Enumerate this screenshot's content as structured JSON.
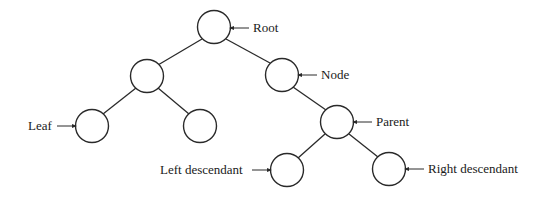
{
  "diagram": {
    "type": "binary-tree",
    "nodes": [
      {
        "id": "root",
        "cx": 214,
        "cy": 27
      },
      {
        "id": "left-child",
        "cx": 147,
        "cy": 76
      },
      {
        "id": "node",
        "cx": 282,
        "cy": 75
      },
      {
        "id": "leaf",
        "cx": 92,
        "cy": 126
      },
      {
        "id": "left-right-leaf",
        "cx": 200,
        "cy": 126
      },
      {
        "id": "parent",
        "cx": 337,
        "cy": 122
      },
      {
        "id": "left-descendant",
        "cx": 287,
        "cy": 170
      },
      {
        "id": "right-descendant",
        "cx": 389,
        "cy": 169
      }
    ],
    "edges": [
      [
        "root",
        "left-child"
      ],
      [
        "root",
        "node"
      ],
      [
        "left-child",
        "leaf"
      ],
      [
        "left-child",
        "left-right-leaf"
      ],
      [
        "node",
        "parent"
      ],
      [
        "parent",
        "left-descendant"
      ],
      [
        "parent",
        "right-descendant"
      ]
    ],
    "labels": {
      "root": "Root",
      "node": "Node",
      "leaf": "Leaf",
      "parent": "Parent",
      "left_descendant": "Left descendant",
      "right_descendant": "Right descendant"
    }
  }
}
